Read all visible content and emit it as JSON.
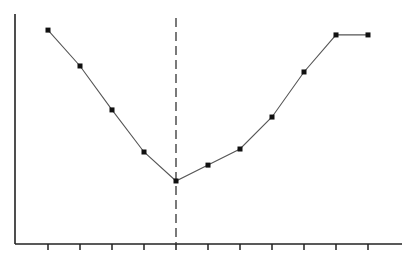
{
  "chart_data": {
    "type": "line",
    "title": "",
    "xlabel": "",
    "ylabel": "",
    "x": [
      1,
      2,
      3,
      4,
      5,
      6,
      7,
      8,
      9,
      10,
      11
    ],
    "series": [
      {
        "name": "series-1",
        "values": [
          93.0,
          77.4,
          58.3,
          40.0,
          27.4,
          34.3,
          41.3,
          55.2,
          74.8,
          90.9,
          90.9
        ]
      }
    ],
    "ylim": [
      0,
      100
    ],
    "xlim": [
      0,
      12
    ],
    "grid": false,
    "legend": null,
    "x_tick_count": 11,
    "x_tick_labels": [],
    "y_tick_labels": [],
    "annotations": [
      {
        "type": "vertical-dashed-line",
        "x": 5,
        "description": "dashed reference line at the minimum point"
      }
    ],
    "marker": "square",
    "line_color": "#555555",
    "marker_color": "#111111",
    "axis_color": "#222222"
  }
}
